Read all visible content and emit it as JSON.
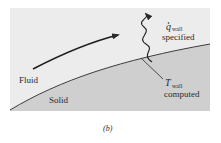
{
  "figure": {
    "caption": "(b)",
    "labels": {
      "fluid": "Fluid",
      "solid": "Solid",
      "q_symbol": "q",
      "q_subscript": "wall",
      "q_text": "specified",
      "t_symbol": "T",
      "t_subscript": "wall",
      "t_text": "computed"
    },
    "colors": {
      "fluid_region": "#ececec",
      "solid_region": "#cfcfcf",
      "line": "#2a2a2a"
    },
    "elements": {
      "flow_arrow": "flow-direction-arrow",
      "heat_flux_arrow": "wavy-heat-flux-arrow",
      "leader_line": "temperature-leader-line"
    }
  }
}
